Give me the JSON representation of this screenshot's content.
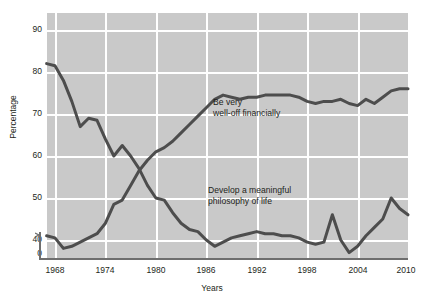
{
  "chart_data": {
    "type": "line",
    "title": "",
    "xlabel": "Years",
    "ylabel": "Percentage",
    "xlim": [
      1967,
      2010
    ],
    "ylim": [
      35,
      93
    ],
    "grid": true,
    "legend_position": "inline-annotations",
    "y_axis_break": true,
    "y_ticks": [
      90,
      80,
      70,
      60,
      50,
      40,
      0
    ],
    "x_ticks": [
      1968,
      1974,
      1980,
      1986,
      1992,
      1998,
      2004,
      2010
    ],
    "series": [
      {
        "name": "Be very well-off financially",
        "color": "#4d4d4d",
        "annotation_line1": "Be very",
        "annotation_line2": "well-off financially",
        "x": [
          1967,
          1968,
          1969,
          1970,
          1971,
          1972,
          1973,
          1974,
          1975,
          1976,
          1977,
          1978,
          1979,
          1980,
          1981,
          1982,
          1983,
          1984,
          1985,
          1986,
          1987,
          1988,
          1989,
          1990,
          1991,
          1992,
          1993,
          1994,
          1995,
          1996,
          1997,
          1998,
          1999,
          2000,
          2001,
          2002,
          2003,
          2004,
          2005,
          2006,
          2007,
          2008,
          2009,
          2010
        ],
        "values": [
          41.0,
          40.5,
          38.0,
          38.5,
          39.5,
          40.5,
          41.5,
          44.0,
          48.5,
          49.5,
          53.0,
          56.5,
          59.0,
          61.0,
          62.0,
          63.5,
          65.5,
          67.5,
          69.5,
          71.5,
          73.5,
          74.5,
          74.0,
          73.5,
          74.0,
          74.0,
          74.5,
          74.5,
          74.5,
          74.5,
          74.0,
          73.0,
          72.5,
          73.0,
          73.0,
          73.5,
          72.5,
          72.0,
          73.5,
          72.5,
          74.0,
          75.5,
          76.0,
          76.0
        ]
      },
      {
        "name": "Develop a meaningful philosophy of life",
        "color": "#4d4d4d",
        "annotation_line1": "Develop a meaningful",
        "annotation_line2": "philosophy of life",
        "x": [
          1967,
          1968,
          1969,
          1970,
          1971,
          1972,
          1973,
          1974,
          1975,
          1976,
          1977,
          1978,
          1979,
          1980,
          1981,
          1982,
          1983,
          1984,
          1985,
          1986,
          1987,
          1988,
          1989,
          1990,
          1991,
          1992,
          1993,
          1994,
          1995,
          1996,
          1997,
          1998,
          1999,
          2000,
          2001,
          2002,
          2003,
          2004,
          2005,
          2006,
          2007,
          2008,
          2009,
          2010
        ],
        "values": [
          82.0,
          81.5,
          78.0,
          73.0,
          67.0,
          69.0,
          68.5,
          64.0,
          60.0,
          62.5,
          60.0,
          57.0,
          53.0,
          50.0,
          49.5,
          46.5,
          44.0,
          42.5,
          42.0,
          40.0,
          38.5,
          39.5,
          40.5,
          41.0,
          41.5,
          42.0,
          41.5,
          41.5,
          41.0,
          41.0,
          40.5,
          39.5,
          39.0,
          39.5,
          46.0,
          40.0,
          37.0,
          38.5,
          41.0,
          43.0,
          45.0,
          50.0,
          47.5,
          46.0
        ]
      }
    ]
  },
  "figure": {
    "y_axis_label": "Percentage",
    "x_axis_label": "Years",
    "y_tick_labels": [
      "90",
      "80",
      "70",
      "60",
      "50",
      "40",
      "0"
    ],
    "x_tick_labels": [
      "1968",
      "1974",
      "1980",
      "1986",
      "1992",
      "1998",
      "2004",
      "2010"
    ],
    "annotations": [
      {
        "id": "well-off",
        "line1": "Be very",
        "line2": "well-off financially"
      },
      {
        "id": "philosophy",
        "line1": "Develop a meaningful",
        "line2": "philosophy of life"
      }
    ],
    "colors": {
      "plot_background": "#c9c9c9",
      "gridline": "#ffffff",
      "line": "#4d4d4d",
      "axis": "#6e6e6e",
      "text": "#231f20"
    }
  }
}
